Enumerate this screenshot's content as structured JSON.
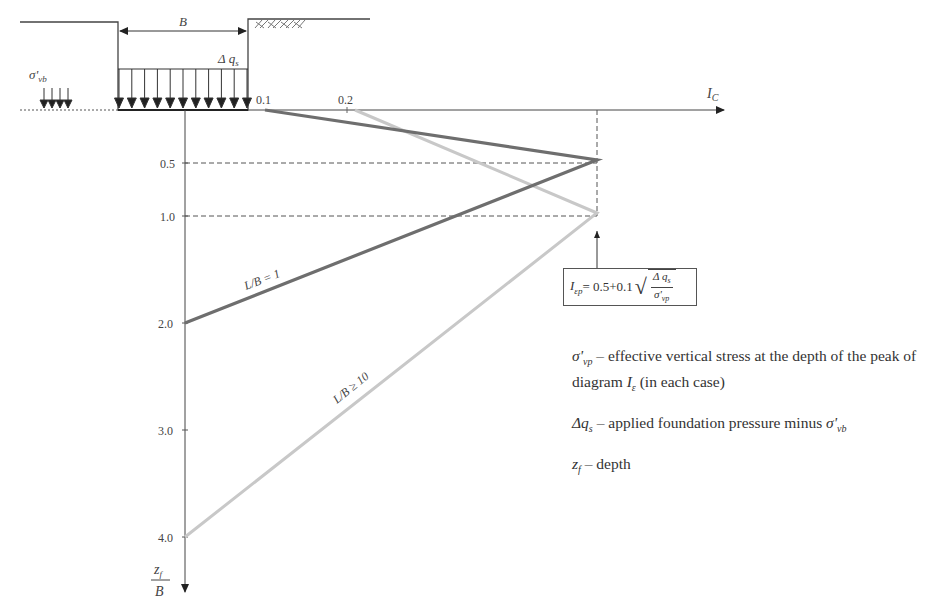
{
  "diagram": {
    "foundation": {
      "width_label": "B",
      "load_label": "Δ q",
      "load_label_sub": "s",
      "overburden_label": "σ'",
      "overburden_label_sub": "vb"
    },
    "x_axis": {
      "label": "I",
      "label_sub": "C",
      "ticks": [
        "0.1",
        "0.2"
      ]
    },
    "y_axis": {
      "label_num": "z",
      "label_num_sub": "f",
      "label_den": "B",
      "ticks": [
        "0.5",
        "1.0",
        "2.0",
        "3.0",
        "4.0"
      ]
    },
    "curves": [
      {
        "name": "L/B = 1",
        "label": "L/B = 1",
        "color": "#6b6b6b",
        "points": [
          [
            0.1,
            0.0
          ],
          [
            0.5,
            0.5
          ],
          [
            0.0,
            2.0
          ]
        ]
      },
      {
        "name": "L/B ≥ 10",
        "label": "L/B ≥ 10",
        "color": "#c4c4c4",
        "points": [
          [
            0.2,
            0.0
          ],
          [
            0.5,
            1.0
          ],
          [
            0.0,
            4.0
          ]
        ]
      }
    ],
    "formula": {
      "lhs": "I",
      "lhs_sub": "εp",
      "rhs_prefix": "= 0.5+0.1",
      "sqrt": "√",
      "num": "Δ q",
      "num_sub": "s",
      "den": "σ'",
      "den_sub": "vp"
    }
  },
  "legend": [
    {
      "symbol": "σ'",
      "symbol_sub": "vp",
      "text": " – effective vertical stress at the depth of the peak of diagram ",
      "tail_symbol": "I",
      "tail_sub": "ε",
      "tail_text": " (in each case)"
    },
    {
      "symbol": "Δq",
      "symbol_sub": "s",
      "text": " – applied foundation pressure minus ",
      "tail_symbol": "σ'",
      "tail_sub": "vb",
      "tail_text": ""
    },
    {
      "symbol": "z",
      "symbol_sub": "f",
      "text": " – depth",
      "tail_symbol": "",
      "tail_sub": "",
      "tail_text": ""
    }
  ]
}
